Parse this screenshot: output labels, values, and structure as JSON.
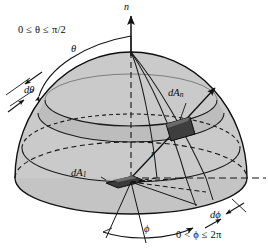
{
  "figure": {
    "background_color": "#ffffff",
    "line_color": "#111111",
    "dome_fill": "#c8c8c8",
    "band_fill": "#bcbcbc",
    "patch_fill": "#3a3a3a",
    "patch_fill_light": "#606060"
  },
  "labels": {
    "normal_axis": "n",
    "theta": "θ",
    "d_theta": "dθ",
    "phi": "ϕ",
    "d_phi": "dϕ",
    "radius": "r",
    "area_normal": "dA",
    "area_normal_sub": "n",
    "area_base": "dA",
    "area_base_sub": "1",
    "theta_range": "0 ≤ θ ≤ π/2",
    "phi_range": "0 < ϕ ≤ 2π"
  },
  "geometry": {
    "center_x": 131,
    "center_y": 178,
    "base_rx": 116,
    "base_ry": 36,
    "dome_top_y": 52,
    "theta_band_top_ry": 26,
    "theta_band_bot_ry": 33,
    "radius_label_value": "r",
    "patch_n_x": 178,
    "patch_n_y": 128,
    "patch_1_x": 117,
    "patch_1_y": 182
  }
}
